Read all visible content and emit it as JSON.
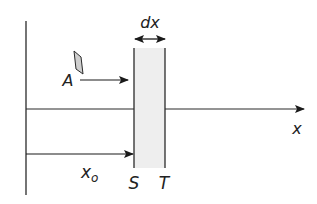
{
  "diagram": {
    "labels": {
      "slab_width": "dx",
      "area": "A",
      "axis": "x",
      "position": "x",
      "position_subscript": "o",
      "left_face": "S",
      "right_face": "T"
    },
    "colors": {
      "line": "#2a2a2a",
      "slab_fill": "#eeeeee",
      "area_fill": "#cfcfcf"
    }
  }
}
